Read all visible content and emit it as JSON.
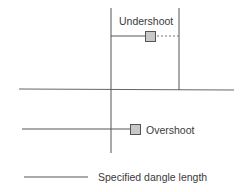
{
  "diagram": {
    "type": "dangle-error-illustration",
    "labels": {
      "undershoot": "Undershoot",
      "overshoot": "Overshoot",
      "legend": "Specified dangle length"
    },
    "colors": {
      "line": "#555555",
      "node_fill": "#c8c8c8",
      "node_stroke": "#555555",
      "text": "#3a3a3a"
    },
    "legend": {
      "symbol": "solid-line",
      "meaning": "Specified dangle length"
    }
  }
}
